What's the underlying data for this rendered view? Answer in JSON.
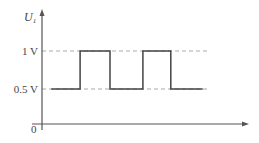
{
  "chart_data": {
    "type": "line",
    "title": "",
    "ylabel": "U",
    "ylabel_subscript": "1",
    "xlabel": "",
    "origin_label": "0",
    "ytick_labels": [
      {
        "value": 1.0,
        "label": "1 V"
      },
      {
        "value": 0.5,
        "label": "0.5 V"
      }
    ],
    "reference_lines": [
      1.0,
      0.5
    ],
    "grid": false,
    "x_range": [
      0,
      10
    ],
    "y_range": [
      0,
      1.3
    ],
    "series": [
      {
        "name": "U1 square wave",
        "step_points": [
          {
            "x": 0.45,
            "y": 0.5
          },
          {
            "x": 1.85,
            "y": 0.5
          },
          {
            "x": 1.85,
            "y": 1.0
          },
          {
            "x": 3.3,
            "y": 1.0
          },
          {
            "x": 3.3,
            "y": 0.5
          },
          {
            "x": 4.9,
            "y": 0.5
          },
          {
            "x": 4.9,
            "y": 1.0
          },
          {
            "x": 6.25,
            "y": 1.0
          },
          {
            "x": 6.25,
            "y": 0.5
          },
          {
            "x": 7.8,
            "y": 0.5
          }
        ]
      }
    ],
    "colors": {
      "axis": "#555555",
      "wave": "#444444",
      "dashed": "#aaaaaa"
    }
  }
}
